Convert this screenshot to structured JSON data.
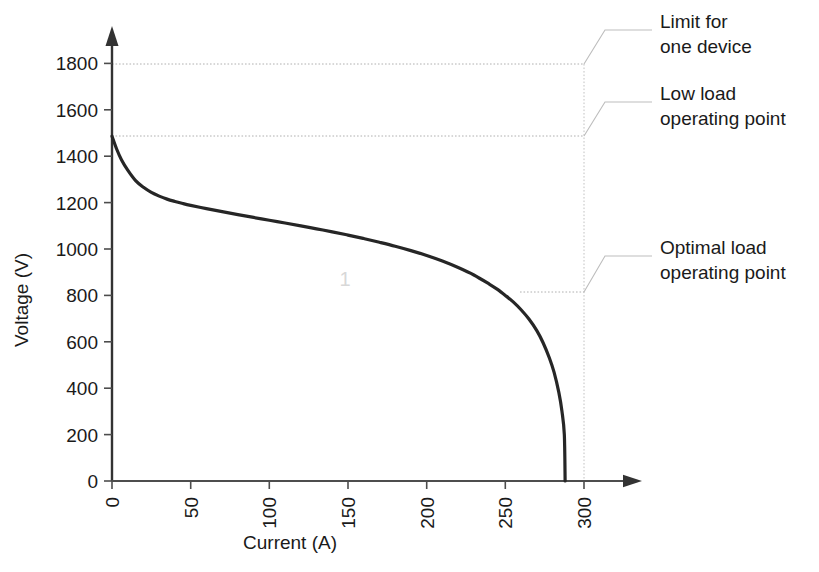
{
  "chart_data": {
    "type": "line",
    "title": "",
    "xlabel": "Current (A)",
    "ylabel": "Voltage (V)",
    "xlim": [
      0,
      300
    ],
    "ylim": [
      0,
      1800
    ],
    "xticks": [
      "0",
      "50",
      "100",
      "150",
      "200",
      "250",
      "300"
    ],
    "xtick_values": [
      0,
      50,
      100,
      150,
      200,
      250,
      300
    ],
    "yticks": [
      "0",
      "200",
      "400",
      "600",
      "800",
      "1000",
      "1200",
      "1400",
      "1600",
      "1800"
    ],
    "ytick_values": [
      0,
      200,
      400,
      600,
      800,
      1000,
      1200,
      1400,
      1600,
      1800
    ],
    "grid": false,
    "legend": "none",
    "series": [
      {
        "name": "Polarization curve",
        "color": "#262626",
        "x": [
          0,
          3,
          6,
          10,
          15,
          20,
          25,
          30,
          35,
          40,
          45,
          50,
          60,
          70,
          80,
          90,
          100,
          110,
          120,
          130,
          140,
          150,
          160,
          170,
          180,
          190,
          200,
          210,
          220,
          230,
          240,
          245,
          250,
          255,
          260,
          265,
          270,
          274,
          278,
          281,
          284,
          286,
          287.5,
          288
        ],
        "y": [
          1486,
          1430,
          1385,
          1340,
          1295,
          1266,
          1244,
          1228,
          1215,
          1205,
          1196,
          1188,
          1174,
          1161,
          1148,
          1136,
          1124,
          1112,
          1100,
          1087,
          1074,
          1060,
          1045,
          1029,
          1012,
          993,
          972,
          948,
          920,
          888,
          848,
          826,
          800,
          772,
          738,
          698,
          648,
          596,
          530,
          468,
          382,
          300,
          200,
          0
        ]
      }
    ],
    "reference_lines": [
      {
        "name": "limit-for-one-device",
        "value": 1800,
        "orientation": "horizontal",
        "style": "dotted"
      },
      {
        "name": "low-load-operating-point",
        "value": 1486,
        "orientation": "horizontal",
        "style": "dotted"
      },
      {
        "name": "optimal-load-operating-point",
        "value": 814,
        "orientation": "horizontal",
        "style": "dotted"
      },
      {
        "name": "current-limit",
        "value": 288,
        "orientation": "vertical",
        "style": "dotted"
      }
    ],
    "annotations": [
      {
        "id": "limit-for-one-device",
        "lines": [
          "Limit for",
          "one device"
        ],
        "target_voltage": 1800
      },
      {
        "id": "low-load-operating-point",
        "lines": [
          "Low load",
          "operating point"
        ],
        "target_voltage": 1486
      },
      {
        "id": "optimal-load-operating-point",
        "lines": [
          "Optimal load",
          "operating point"
        ],
        "target_voltage": 814
      }
    ],
    "watermark": "1"
  },
  "colors": {
    "curve": "#262626",
    "axis": "#4d4d4d",
    "dotted": "#b0b0b0",
    "leader": "#b8b8b8",
    "text": "#1a1a1a",
    "watermark": "#d8d8d8",
    "background": "#ffffff"
  }
}
